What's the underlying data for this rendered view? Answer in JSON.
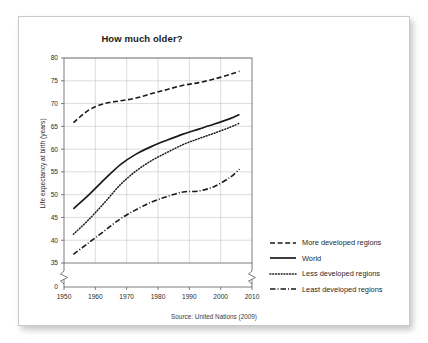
{
  "card": {
    "background": "#ffffff",
    "border_color": "#c9c9c9"
  },
  "chart_data": {
    "type": "line",
    "title": "How much older?",
    "xlabel": "",
    "ylabel": "Life expectancy at birth (years)",
    "source": "Source: United Nations (2009)",
    "xlim": [
      1950,
      2010
    ],
    "ylim": [
      35,
      80
    ],
    "y_broken_from_zero": true,
    "y_break_label": "0",
    "grid": true,
    "legend_position": "right",
    "xticks": [
      1950,
      1960,
      1970,
      1980,
      1990,
      2000,
      2010
    ],
    "xtick_labels": [
      "1950",
      "1960",
      "1970",
      "1980",
      "1990",
      "2000",
      "2010"
    ],
    "yticks": [
      35,
      40,
      45,
      50,
      55,
      60,
      65,
      70,
      75,
      80
    ],
    "ytick_labels": [
      "35",
      "40",
      "45",
      "50",
      "55",
      "60",
      "65",
      "70",
      "75",
      "80"
    ],
    "x": [
      1953,
      1958,
      1963,
      1968,
      1973,
      1978,
      1983,
      1988,
      1993,
      1998,
      2003,
      2006
    ],
    "series": [
      {
        "name": "More developed regions",
        "style": "dashed",
        "color": "#1a1a1a",
        "values": [
          65.8,
          68.6,
          70.0,
          70.6,
          71.2,
          72.2,
          73.1,
          74.0,
          74.6,
          75.4,
          76.4,
          77.1
        ]
      },
      {
        "name": "World",
        "style": "solid",
        "color": "#1a1a1a",
        "values": [
          46.9,
          50.0,
          53.4,
          56.6,
          58.9,
          60.6,
          62.0,
          63.3,
          64.4,
          65.5,
          66.7,
          67.6
        ]
      },
      {
        "name": "Less developed regions",
        "style": "dotted",
        "color": "#1a1a1a",
        "values": [
          41.3,
          44.6,
          48.3,
          52.2,
          55.2,
          57.5,
          59.3,
          61.0,
          62.3,
          63.5,
          64.8,
          65.7
        ]
      },
      {
        "name": "Least developed regions",
        "style": "dashdot",
        "color": "#1a1a1a",
        "values": [
          36.9,
          39.5,
          42.1,
          44.7,
          46.7,
          48.4,
          49.6,
          50.6,
          50.8,
          51.8,
          53.8,
          55.6
        ]
      }
    ]
  },
  "legend": {
    "items": [
      {
        "label": "More developed regions",
        "style": "dashed"
      },
      {
        "label": "World",
        "style": "solid"
      },
      {
        "label": "Less developed regions",
        "style": "dotted"
      },
      {
        "label": "Least developed regions",
        "style": "dashdot"
      }
    ]
  }
}
